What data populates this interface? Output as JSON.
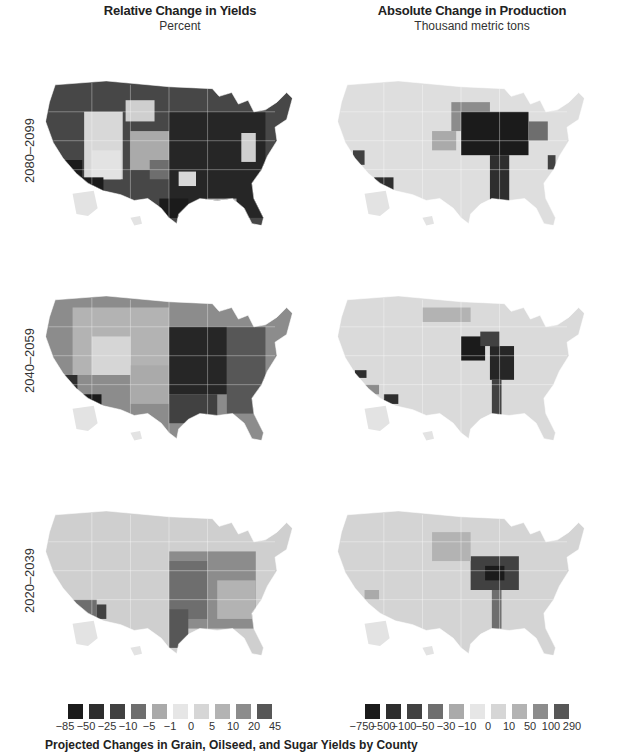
{
  "figure": {
    "caption": "Projected Changes in Grain, Oilseed, and Sugar Yields by County"
  },
  "columns": [
    {
      "title": "Relative Change in Yields",
      "subtitle": "Percent"
    },
    {
      "title": "Absolute Change in Production",
      "subtitle": "Thousand metric tons"
    }
  ],
  "rows": [
    {
      "label": "2080–2099"
    },
    {
      "label": "2040–2059"
    },
    {
      "label": "2020–2039"
    }
  ],
  "legends": {
    "relative": {
      "labels": [
        "-85",
        "-50",
        "-25",
        "-10",
        "-5",
        "-1",
        "0",
        "5",
        "10",
        "20",
        "45"
      ],
      "colors": [
        "#1b1b1b",
        "#2e2e2e",
        "#414141",
        "#6e6e6e",
        "#aaaaaa",
        "#e6e6e6",
        "#d6d6d6",
        "#b3b3b3",
        "#8c8c8c",
        "#575757"
      ]
    },
    "absolute": {
      "labels": [
        "-750",
        "-500",
        "-100",
        "-50",
        "-30",
        "-10",
        "0",
        "10",
        "50",
        "100",
        "290"
      ],
      "colors": [
        "#1b1b1b",
        "#2e2e2e",
        "#414141",
        "#6e6e6e",
        "#aaaaaa",
        "#e6e6e6",
        "#d6d6d6",
        "#b3b3b3",
        "#8c8c8c",
        "#575757"
      ]
    }
  },
  "chart_data": [
    {
      "type": "heatmap",
      "title": "Relative Change in Yields",
      "subtitle": "Percent",
      "description": "County-level choropleth maps of the contiguous US (plus Alaska/Hawaii insets) for three periods",
      "periods": [
        "2080–2099",
        "2040–2059",
        "2020–2039"
      ],
      "legend_bins": [
        "-85",
        "-50",
        "-25",
        "-10",
        "-5",
        "-1",
        "0",
        "5",
        "10",
        "20",
        "45"
      ],
      "regional_summary": {
        "2080–2099": {
          "Midwest/Corn Belt": "-50 to -85",
          "South/Southeast": "-25 to -85",
          "Northern Plains": "-25 to -50",
          "Mountain West": "-1 to 10",
          "Pacific Northwest": "-25 to -50",
          "Southwest/AZ": "-50 to -85"
        },
        "2040–2059": {
          "Midwest/Corn Belt": "-25 to -50",
          "South/Southeast": "-10 to -50",
          "Northern Plains": "-1 to 10",
          "Mountain West": "0 to 10",
          "Southwest/AZ": "-25 to -85"
        },
        "2020–2039": {
          "Midwest/Corn Belt": "-5 to -25",
          "South/Southeast": "-5 to -10",
          "Northern Plains": "0 to 5",
          "Mountain West": "0 to 5",
          "Southwest/AZ": "-10 to -50"
        }
      },
      "legend_position": "bottom"
    },
    {
      "type": "heatmap",
      "title": "Absolute Change in Production",
      "subtitle": "Thousand metric tons",
      "periods": [
        "2080–2099",
        "2040–2059",
        "2020–2039"
      ],
      "legend_bins": [
        "-750",
        "-500",
        "-100",
        "-50",
        "-30",
        "-10",
        "0",
        "10",
        "50",
        "100",
        "290"
      ],
      "regional_summary": {
        "2080–2099": {
          "Iowa/Illinois/Nebraska": "-500 to -750",
          "Mississippi Delta": "-100 to -500",
          "Central Valley CA": "-50 to -100",
          "Rest of US": "-10 to 10"
        },
        "2040–2059": {
          "Iowa/Illinois/Nebraska": "-100 to -500",
          "Mississippi Delta": "-50 to -100",
          "Central Valley CA": "-100 to -500",
          "Rest of US": "-10 to 10"
        },
        "2020–2039": {
          "Iowa/Illinois": "-50 to -100",
          "Mississippi Delta": "-30 to -50",
          "Rest of US": "-10 to 10"
        }
      },
      "legend_position": "bottom"
    }
  ]
}
